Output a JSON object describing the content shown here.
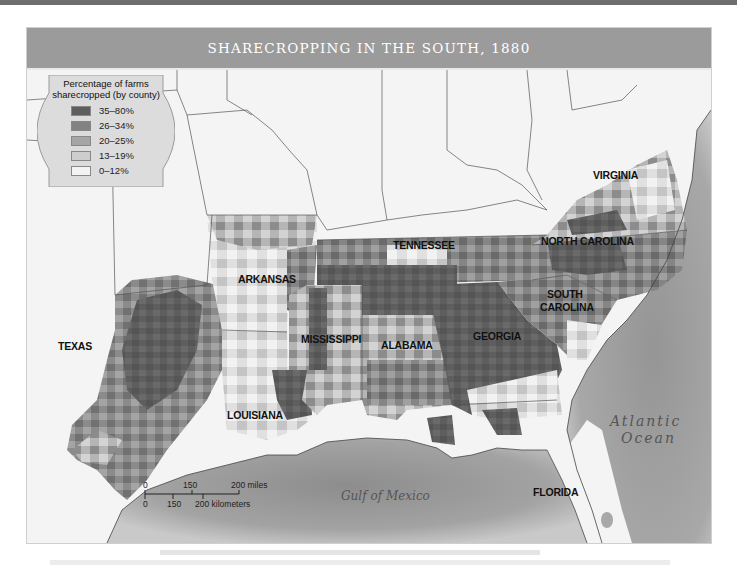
{
  "title": "SHARECROPPING IN THE SOUTH, 1880",
  "legend": {
    "title_line1": "Percentage of farms",
    "title_line2": "sharecropped (by county)",
    "items": [
      {
        "label": "35–80%",
        "color": "#5e5e5e"
      },
      {
        "label": "26–34%",
        "color": "#828282"
      },
      {
        "label": "20–25%",
        "color": "#a5a5a5"
      },
      {
        "label": "13–19%",
        "color": "#cdcdcd"
      },
      {
        "label": "0–12%",
        "color": "#f3f3f3"
      }
    ]
  },
  "states": {
    "virginia": "VIRGINIA",
    "north_carolina": "NORTH CAROLINA",
    "tennessee": "TENNESSEE",
    "arkansas": "ARKANSAS",
    "south_carolina_1": "SOUTH",
    "south_carolina_2": "CAROLINA",
    "texas": "TEXAS",
    "mississippi": "MISSISSIPPI",
    "alabama": "ALABAMA",
    "georgia": "GEORGIA",
    "louisiana": "LOUISIANA",
    "florida": "FLORIDA"
  },
  "water": {
    "atlantic_1": "Atlantic",
    "atlantic_2": "Ocean",
    "gulf": "Gulf of Mexico"
  },
  "scale": {
    "miles_0": "0",
    "miles_150": "150",
    "miles_200": "200 miles",
    "km_0": "0",
    "km_150": "150",
    "km_200": "200 kilometers"
  },
  "colors": {
    "header_bg": "#9b9b9b",
    "water": "#9a9a9a",
    "land": "#f4f4f4"
  }
}
